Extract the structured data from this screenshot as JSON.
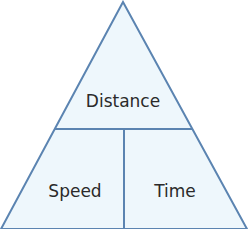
{
  "diagram": {
    "type": "formula-triangle",
    "top_label": "Distance",
    "bottom_left_label": "Speed",
    "bottom_right_label": "Time",
    "colors": {
      "fill": "#eef7fc",
      "stroke": "#5b84b1",
      "text": "#2a2a2a"
    }
  }
}
